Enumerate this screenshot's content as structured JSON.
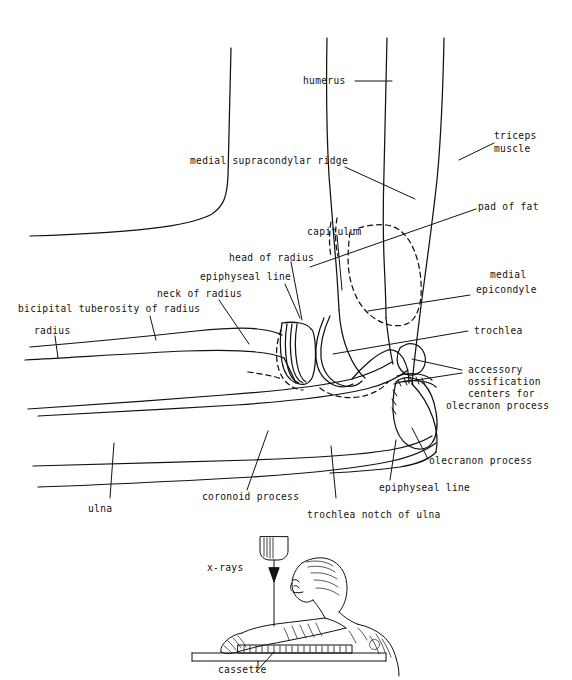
{
  "figure": {
    "ink_color": "#14110f",
    "background_color": "#ffffff"
  },
  "labels": {
    "humerus": "humerus",
    "triceps_muscle_line1": "triceps",
    "triceps_muscle_line2": "muscle",
    "medial_supracondylar_ridge": "medial supracondylar ridge",
    "pad_of_fat": "pad of fat",
    "capitulum": "capitulum",
    "head_of_radius": "head of radius",
    "epiphyseal_line_upper": "epiphyseal line",
    "medial_line1": "medial",
    "medial_line2": "epicondyle",
    "neck_of_radius": "neck of radius",
    "bicipital_tuberosity_of_radius": "bicipital tuberosity of radius",
    "radius": "radius",
    "trochlea": "trochlea",
    "accessory_line1": "accessory",
    "accessory_line2": "ossification",
    "accessory_line3": "centers for",
    "accessory_line4": "olecranon process",
    "olecranon_process": "olecranon process",
    "epiphyseal_line_lower": "epiphyseal line",
    "coronoid_process": "coronoid process",
    "trochlea_notch_of_ulna": "trochlea notch of ulna",
    "ulna": "ulna",
    "x_rays": "x-rays",
    "cassette": "cassette"
  },
  "inset": {
    "caption_xrays": "x-rays",
    "caption_cassette": "cassette",
    "description": "patient seated at table with arm on cassette, x-ray tube above"
  }
}
